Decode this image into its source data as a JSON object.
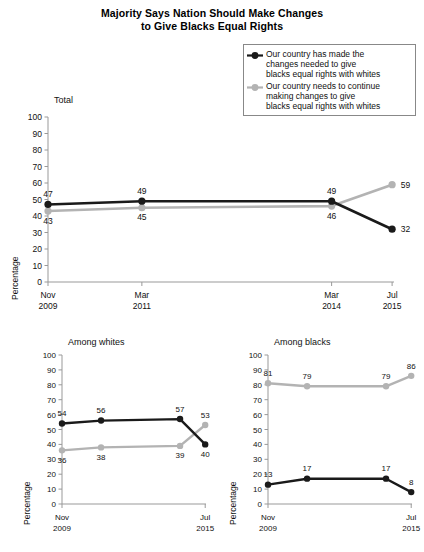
{
  "title": {
    "line1": "Majority Says Nation Should Make Changes",
    "line2": "to Give Blacks Equal Rights"
  },
  "legend": {
    "items": [
      {
        "marker": "black-diamond-marker",
        "color": "#1a1a1a",
        "line1": "Our country has made the",
        "line2": "changes needed to give",
        "line3": "blacks equal rights with whites"
      },
      {
        "marker": "gray-diamond-marker",
        "color": "#b3b3b3",
        "line1": "Our country needs to continue",
        "line2": "making changes to give",
        "line3": "blacks equal rights with whites"
      }
    ]
  },
  "chart_data": [
    {
      "type": "line",
      "title": "Total",
      "xlabel": "",
      "ylabel": "Percentage",
      "ylim": [
        0,
        100
      ],
      "yticks": [
        0,
        10,
        20,
        30,
        40,
        50,
        60,
        70,
        80,
        90,
        100
      ],
      "grid": false,
      "legend_position": "top-right",
      "categories": [
        "Nov\n2009",
        "Mar\n2011",
        "Mar\n2014",
        "Jul\n2015"
      ],
      "tick_labels": [
        {
          "month": "Nov",
          "year": "2009"
        },
        {
          "month": "Mar",
          "year": "2011"
        },
        {
          "month": "Mar",
          "year": "2014"
        },
        {
          "month": "Jul",
          "year": "2015"
        }
      ],
      "x_positions": [
        0.0,
        0.2713,
        0.8197,
        0.9945
      ],
      "series": [
        {
          "name": "Our country has made the changes needed to give blacks equal rights with whites",
          "color": "#1a1a1a",
          "values": [
            47,
            49,
            49,
            32
          ],
          "label_positions": [
            "above",
            "above",
            "above",
            "right"
          ]
        },
        {
          "name": "Our country needs to continue making changes to give blacks equal rights with whites",
          "color": "#b3b3b3",
          "values": [
            43,
            45,
            46,
            59
          ],
          "label_positions": [
            "below",
            "below",
            "below",
            "right"
          ]
        }
      ]
    },
    {
      "type": "line",
      "title": "Among whites",
      "xlabel": "",
      "ylabel": "Percentage",
      "ylim": [
        0,
        100
      ],
      "yticks": [
        0,
        10,
        20,
        30,
        40,
        50,
        60,
        70,
        80,
        90,
        100
      ],
      "grid": false,
      "categories": [
        "Nov\n2009",
        "Mar\n2011",
        "Mar\n2014",
        "Jul\n2015"
      ],
      "tick_labels": [
        {
          "month": "Nov",
          "year": "2009"
        },
        {
          "month": "Jul",
          "year": "2015"
        }
      ],
      "x_positions": [
        0.0,
        0.2713,
        0.8197,
        0.9945
      ],
      "series": [
        {
          "name": "Our country has made the changes needed to give blacks equal rights with whites",
          "color": "#1a1a1a",
          "values": [
            54,
            56,
            57,
            40
          ],
          "label_positions": [
            "above",
            "above",
            "above",
            "below"
          ]
        },
        {
          "name": "Our country needs to continue making changes to give blacks equal rights with whites",
          "color": "#b3b3b3",
          "values": [
            36,
            38,
            39,
            53
          ],
          "label_positions": [
            "below",
            "below",
            "below",
            "above"
          ]
        }
      ]
    },
    {
      "type": "line",
      "title": "Among blacks",
      "xlabel": "",
      "ylabel": "Percentage",
      "ylim": [
        0,
        100
      ],
      "yticks": [
        0,
        10,
        20,
        30,
        40,
        50,
        60,
        70,
        80,
        90,
        100
      ],
      "grid": false,
      "categories": [
        "Nov\n2009",
        "Mar\n2011",
        "Mar\n2014",
        "Jul\n2015"
      ],
      "tick_labels": [
        {
          "month": "Nov",
          "year": "2009"
        },
        {
          "month": "Jul",
          "year": "2015"
        }
      ],
      "x_positions": [
        0.0,
        0.2713,
        0.8197,
        0.9945
      ],
      "series": [
        {
          "name": "Our country has made the changes needed to give blacks equal rights with whites",
          "color": "#1a1a1a",
          "values": [
            13,
            17,
            17,
            8
          ],
          "label_positions": [
            "above",
            "above",
            "above",
            "above"
          ]
        },
        {
          "name": "Our country needs to continue making changes to give blacks equal rights with whites",
          "color": "#b3b3b3",
          "values": [
            81,
            79,
            79,
            86
          ],
          "label_positions": [
            "above",
            "above",
            "above",
            "above"
          ]
        }
      ]
    }
  ]
}
